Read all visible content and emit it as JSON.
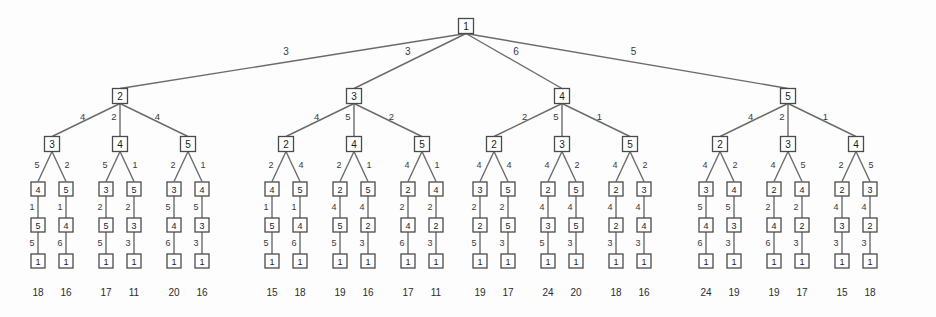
{
  "diagram": {
    "type": "tree",
    "node_shape": "square-box",
    "colors": {
      "background": "#fdfdfd",
      "node_fill": "#ffffff",
      "node_stroke": "#4a4a4a",
      "edge_stroke": "#6b6b6b",
      "label_text": "#1a1a1a",
      "weight_text": "#3a3a3a",
      "total_text": "#2b2b2b"
    },
    "levels": 7,
    "leaf_count": 24,
    "root": {
      "label": "1"
    },
    "level1_labels": [
      "2",
      "3",
      "4",
      "5"
    ],
    "level1_weights": [
      "3",
      "3",
      "6",
      "5"
    ],
    "level2_labels": [
      "3",
      "4",
      "5",
      "2",
      "4",
      "5",
      "2",
      "3",
      "5",
      "2",
      "3",
      "4"
    ],
    "level2_weights": [
      "4",
      "2",
      "4",
      "4",
      "5",
      "2",
      "2",
      "5",
      "1",
      "4",
      "2",
      "1"
    ],
    "level3_labels": [
      "4",
      "5",
      "3",
      "5",
      "3",
      "4",
      "4",
      "5",
      "2",
      "5",
      "2",
      "4",
      "3",
      "5",
      "2",
      "5",
      "2",
      "3",
      "3",
      "4",
      "2",
      "4",
      "2",
      "3"
    ],
    "level3_weights": [
      "5",
      "2",
      "5",
      "1",
      "2",
      "1",
      "2",
      "4",
      "2",
      "1",
      "4",
      "1",
      "4",
      "4",
      "4",
      "2",
      "4",
      "2",
      "4",
      "2",
      "4",
      "5",
      "2",
      "5"
    ],
    "level4_labels": [
      "5",
      "4",
      "5",
      "3",
      "4",
      "3",
      "5",
      "4",
      "5",
      "2",
      "4",
      "2",
      "2",
      "5",
      "3",
      "5",
      "2",
      "4",
      "4",
      "3",
      "4",
      "2",
      "3",
      "2"
    ],
    "level4_weights": [
      "1",
      "1",
      "2",
      "2",
      "5",
      "5",
      "1",
      "1",
      "4",
      "4",
      "2",
      "2",
      "2",
      "2",
      "4",
      "4",
      "4",
      "4",
      "5",
      "5",
      "2",
      "2",
      "4",
      "4"
    ],
    "level5_labels": [
      "1",
      "1",
      "1",
      "1",
      "1",
      "1",
      "1",
      "1",
      "1",
      "1",
      "1",
      "1",
      "1",
      "1",
      "1",
      "1",
      "1",
      "1",
      "1",
      "1",
      "1",
      "1",
      "1",
      "1"
    ],
    "level5_weights": [
      "5",
      "6",
      "5",
      "3",
      "6",
      "3",
      "5",
      "6",
      "5",
      "3",
      "6",
      "3",
      "5",
      "3",
      "5",
      "3",
      "3",
      "3",
      "6",
      "3",
      "6",
      "3",
      "3",
      "3"
    ],
    "leaf_totals": [
      "18",
      "16",
      "17",
      "11",
      "20",
      "16",
      "15",
      "18",
      "19",
      "16",
      "17",
      "11",
      "19",
      "17",
      "24",
      "20",
      "18",
      "16",
      "24",
      "19",
      "19",
      "17",
      "15",
      "18"
    ]
  }
}
